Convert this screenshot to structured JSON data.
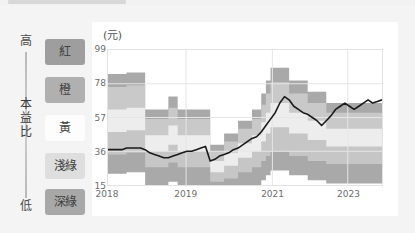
{
  "pe_axis": {
    "high_label": "高",
    "low_label": "低",
    "title_chars": [
      "本",
      "益",
      "比"
    ]
  },
  "legend": {
    "items": [
      {
        "label": "紅",
        "color": "#9e9e9e",
        "text_color": "#3f3f3f"
      },
      {
        "label": "橙",
        "color": "#b0b0b0",
        "text_color": "#3f3f3f"
      },
      {
        "label": "黃",
        "color": "#fdfdfd",
        "text_color": "#3f3f3f"
      },
      {
        "label": "淺綠",
        "color": "#dedede",
        "text_color": "#3f3f3f"
      },
      {
        "label": "深綠",
        "color": "#a8a8a8",
        "text_color": "#3f3f3f"
      }
    ]
  },
  "chart_data": {
    "type": "area",
    "title": "",
    "subtitle": "",
    "unit_label": "(元)",
    "xlabel": "",
    "ylabel": "",
    "ylim": [
      15,
      99
    ],
    "yticks": [
      99,
      78,
      57,
      36,
      15
    ],
    "xticks": [
      "2018",
      "2019",
      "2021",
      "2023"
    ],
    "xtick_positions": [
      0.0,
      0.285,
      0.6,
      0.875
    ],
    "grid": true,
    "stacked": true,
    "legend_position": "left-outside",
    "band_colors": [
      "#a9a9a9",
      "#c6c6c6",
      "#ededed",
      "#c9c9c9",
      "#9f9f9f"
    ],
    "band_names": [
      "深綠",
      "淺綠",
      "黃",
      "橙",
      "紅"
    ],
    "x": [
      0,
      1,
      2,
      3,
      4,
      5,
      6,
      7,
      8,
      9,
      10,
      11,
      12,
      13,
      14,
      15,
      16,
      17,
      18,
      19,
      20,
      21,
      22,
      23,
      24,
      25,
      26,
      27,
      28,
      29,
      30,
      31,
      32,
      33,
      34,
      35,
      36,
      37,
      38,
      39,
      40,
      41,
      42,
      43,
      44,
      45,
      46,
      47,
      48,
      49,
      50,
      51,
      52,
      53,
      54,
      55,
      56,
      57,
      58,
      59
    ],
    "series": [
      {
        "name": "band_top_紅",
        "values": [
          84,
          84,
          84,
          84,
          85,
          85,
          85,
          85,
          62,
          62,
          62,
          62,
          62,
          70,
          70,
          62,
          62,
          62,
          62,
          62,
          62,
          62,
          40,
          40,
          40,
          47,
          47,
          47,
          55,
          55,
          55,
          62,
          62,
          72,
          80,
          88,
          88,
          88,
          88,
          80,
          80,
          80,
          80,
          73,
          73,
          73,
          73,
          66,
          66,
          66,
          66,
          66,
          66,
          66,
          66,
          66,
          66,
          66,
          66,
          66
        ]
      },
      {
        "name": "band_top_橙",
        "values": [
          76,
          76,
          76,
          76,
          77,
          77,
          77,
          77,
          56,
          56,
          56,
          56,
          56,
          63,
          63,
          56,
          56,
          56,
          56,
          56,
          56,
          56,
          36,
          36,
          36,
          42,
          42,
          42,
          50,
          50,
          50,
          56,
          56,
          65,
          72,
          79,
          79,
          79,
          79,
          72,
          72,
          72,
          72,
          66,
          66,
          66,
          66,
          60,
          60,
          60,
          60,
          60,
          60,
          60,
          60,
          60,
          60,
          60,
          60,
          60
        ]
      },
      {
        "name": "band_top_黃",
        "values": [
          62,
          62,
          62,
          62,
          63,
          63,
          63,
          63,
          46,
          46,
          46,
          46,
          46,
          52,
          52,
          46,
          46,
          46,
          46,
          46,
          46,
          46,
          30,
          30,
          30,
          35,
          35,
          35,
          41,
          41,
          41,
          46,
          46,
          54,
          60,
          66,
          66,
          66,
          66,
          60,
          60,
          60,
          60,
          55,
          55,
          55,
          55,
          50,
          50,
          50,
          50,
          50,
          50,
          50,
          50,
          50,
          50,
          50,
          50,
          50
        ]
      },
      {
        "name": "band_top_淺綠",
        "values": [
          48,
          48,
          48,
          48,
          49,
          49,
          49,
          49,
          36,
          36,
          36,
          36,
          36,
          40,
          40,
          36,
          36,
          36,
          36,
          36,
          36,
          36,
          23,
          23,
          23,
          27,
          27,
          27,
          32,
          32,
          32,
          36,
          36,
          42,
          47,
          51,
          51,
          51,
          51,
          47,
          47,
          47,
          47,
          43,
          43,
          43,
          43,
          39,
          39,
          39,
          39,
          39,
          39,
          39,
          39,
          39,
          39,
          39,
          39,
          39
        ]
      },
      {
        "name": "band_bottom_深綠",
        "values": [
          34,
          34,
          34,
          34,
          35,
          35,
          35,
          35,
          26,
          26,
          26,
          26,
          26,
          29,
          29,
          26,
          26,
          26,
          26,
          26,
          26,
          26,
          17,
          17,
          17,
          19,
          19,
          19,
          23,
          23,
          23,
          26,
          26,
          30,
          33,
          36,
          36,
          36,
          36,
          33,
          33,
          33,
          33,
          30,
          30,
          30,
          30,
          28,
          28,
          28,
          28,
          28,
          28,
          28,
          28,
          28,
          28,
          28,
          28,
          28
        ]
      },
      {
        "name": "股價",
        "color": "#1a1a1a",
        "values": [
          37,
          37,
          37,
          37,
          38,
          38,
          38,
          38,
          37,
          35,
          34,
          33,
          32,
          32,
          33,
          34,
          35,
          36,
          36,
          37,
          38,
          39,
          30,
          31,
          33,
          34,
          35,
          37,
          38,
          40,
          42,
          44,
          45,
          48,
          52,
          56,
          60,
          66,
          70,
          68,
          64,
          62,
          60,
          59,
          57,
          55,
          52,
          55,
          58,
          62,
          64,
          66,
          64,
          62,
          64,
          66,
          68,
          66,
          67,
          68
        ]
      }
    ]
  }
}
